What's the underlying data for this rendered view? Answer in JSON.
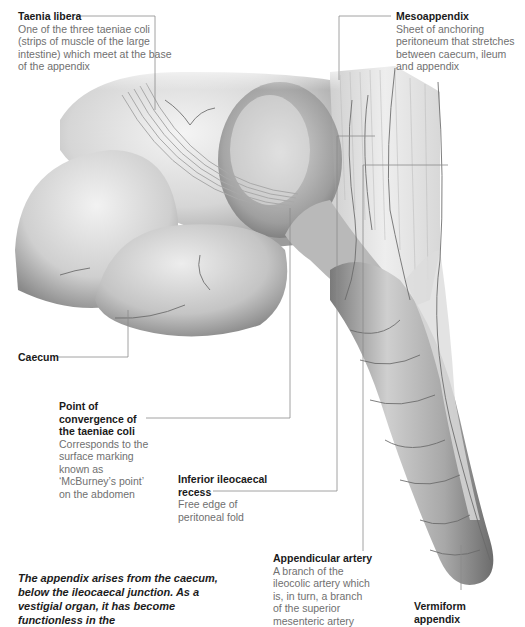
{
  "diagram": {
    "labels": [
      {
        "id": "taenia-libera",
        "title": "Taenia libera",
        "description": "One of the three taeniae coli (strips of muscle of the large intestine) which meet at the base of the appendix"
      },
      {
        "id": "mesoappendix",
        "title": "Mesoappendix",
        "description": "Sheet of anchoring peritoneum that stretches between caecum, ileum and appendix"
      },
      {
        "id": "caecum",
        "title": "Caecum",
        "description": ""
      },
      {
        "id": "point-of-convergence",
        "title": "Point of convergence of the taeniae coli",
        "description": "Corresponds to the surface marking known as ‘McBurney’s point’ on the abdomen"
      },
      {
        "id": "inferior-ileocaecal-recess",
        "title": "Inferior ileocaecal recess",
        "description": "Free edge of peritoneal fold"
      },
      {
        "id": "appendicular-artery",
        "title": "Appendicular artery",
        "description": "A branch of the ileocolic artery which is, in turn, a branch of the superior mesenteric artery"
      },
      {
        "id": "vermiform-appendix",
        "title": "Vermiform appendix",
        "description": ""
      }
    ],
    "caption": "The appendix arises from the caecum, below the ileocaecal junction. As a vestigial organ, it has become functionless in the",
    "colors": {
      "leader_line": "#8a8a8a",
      "title_text": "#1a1a1a",
      "body_text": "#707070",
      "organ_light": "#ececec",
      "organ_mid": "#b4b4b4",
      "organ_dark": "#6e6e6e",
      "vessel": "#6a6a6a"
    }
  }
}
